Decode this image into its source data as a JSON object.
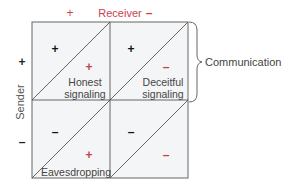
{
  "axes": {
    "receiver_label": "Receiver",
    "receiver_plus": "+",
    "receiver_minus": "–",
    "sender_label": "Sender",
    "sender_plus": "+",
    "sender_minus": "–"
  },
  "cells": [
    {
      "sender_sign": "+",
      "receiver_sign": "+",
      "label_line1": "Honest",
      "label_line2": "signaling"
    },
    {
      "sender_sign": "+",
      "receiver_sign": "–",
      "label_line1": "Deceitful",
      "label_line2": "signaling"
    },
    {
      "sender_sign": "–",
      "receiver_sign": "+",
      "label_line1": "Eavesdropping",
      "label_line2": ""
    },
    {
      "sender_sign": "–",
      "receiver_sign": "–",
      "label_line1": "",
      "label_line2": ""
    }
  ],
  "bracket_label": "Communication",
  "colors": {
    "accent_red": "#c8414b",
    "text_gray": "#555555",
    "cell_fill": "#f4f5f6",
    "border": "#666666"
  }
}
